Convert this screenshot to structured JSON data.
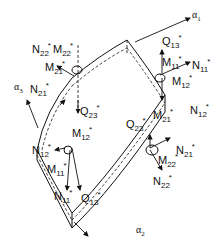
{
  "figure": {
    "axes": [
      {
        "id": "a1",
        "symbol": "α",
        "sub": "1"
      },
      {
        "id": "a2",
        "symbol": "α",
        "sub": "2"
      },
      {
        "id": "a3",
        "symbol": "α",
        "sub": "3"
      }
    ],
    "labels": [
      {
        "id": "N22_top",
        "base": "N",
        "sub": "22",
        "sup": "*"
      },
      {
        "id": "M22_top",
        "base": "M",
        "sub": "22",
        "sup": "*"
      },
      {
        "id": "M21_top",
        "base": "M",
        "sub": "21",
        "sup": "*"
      },
      {
        "id": "N21_left",
        "base": "N",
        "sub": "21",
        "sup": "*"
      },
      {
        "id": "Q23_left",
        "base": "Q",
        "sub": "23",
        "sup": "*"
      },
      {
        "id": "Q13_top",
        "base": "Q",
        "sub": "13",
        "sup": "*"
      },
      {
        "id": "M11_right",
        "base": "M",
        "sub": "11",
        "sup": "*"
      },
      {
        "id": "N11_right",
        "base": "N",
        "sub": "11",
        "sup": "*"
      },
      {
        "id": "M12_right",
        "base": "M",
        "sub": "12",
        "sup": "*"
      },
      {
        "id": "N12_right",
        "base": "N",
        "sub": "12",
        "sup": "*"
      },
      {
        "id": "Q23_center",
        "base": "Q",
        "sub": "23",
        "sup": "*"
      },
      {
        "id": "M21_center",
        "base": "M",
        "sub": "21",
        "sup": "*"
      },
      {
        "id": "N21_right",
        "base": "N",
        "sub": "21",
        "sup": "*"
      },
      {
        "id": "M22_bottom",
        "base": "M",
        "sub": "22",
        "sup": "*"
      },
      {
        "id": "N22_bottom",
        "base": "N",
        "sub": "22",
        "sup": "*"
      },
      {
        "id": "N12_left",
        "base": "N",
        "sub": "12",
        "sup": "*"
      },
      {
        "id": "M12_left",
        "base": "M",
        "sub": "12",
        "sup": "*"
      },
      {
        "id": "M11_left",
        "base": "M",
        "sub": "11",
        "sup": "*"
      },
      {
        "id": "N11_bottom",
        "base": "N",
        "sub": "11",
        "sup": "*"
      },
      {
        "id": "Q13_bottom",
        "base": "Q",
        "sub": "13",
        "sup": "*"
      }
    ]
  }
}
